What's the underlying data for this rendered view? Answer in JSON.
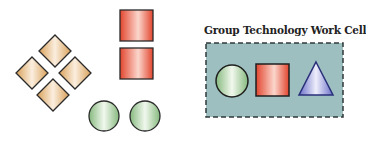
{
  "diagram": {
    "work_cell": {
      "title": "Group Technology Work Cell",
      "background": "#9dbfc0",
      "border": "dashed",
      "members": [
        "circle",
        "square",
        "triangle"
      ]
    },
    "loose_parts": {
      "diamonds": 4,
      "squares": 2,
      "circles": 2
    },
    "colors": {
      "diamond": "#e7b97a",
      "square": "#e8553f",
      "circle": "#9fcb95",
      "triangle": "#7d82d0",
      "outline": "#1f1f1f"
    }
  }
}
